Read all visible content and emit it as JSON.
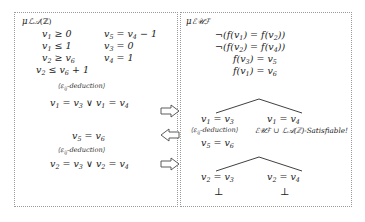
{
  "figure": {
    "left_panel": {
      "label": "μₗₐ(ℤ)",
      "label_text": "μLA(Z)",
      "constraints_col1": [
        "v₁ ≥ 0",
        "v₁ ≤ 1",
        "v₂ ≥ v₆",
        "v₂ ≤ v₆ + 1"
      ],
      "constraints_col2": [
        "v₅ = v₄ − 1",
        "v₃ = 0",
        "v₄ = 1"
      ],
      "deduction_label_1": "⟨εᵢⱼ-deduction⟩",
      "deduced_1": "v₁ = v₃ ∨ v₁ = v₄",
      "fact_1": "v₅ = v₆",
      "deduction_label_2": "⟨εᵢⱼ-deduction⟩",
      "deduced_2": "v₂ = v₃ ∨ v₂ = v₄"
    },
    "right_panel": {
      "label_text": "μEUF",
      "literals": [
        "¬(f(v₁) = f(v₂))",
        "¬(f(v₂) = f(v₄))",
        "f(v₃) = v₅",
        "f(v₁) = v₆"
      ],
      "tree1_left": "v₁ = v₃",
      "tree1_right": "v₁ = v₄",
      "tree1_deduction_label": "⟨εᵢⱼ-deduction⟩",
      "tree1_satisfiable": "ℰᵁℱ ∪ ℒᴀ(ℤ)-Satisfiable!",
      "tree1_left_child": "v₅ = v₆",
      "tree2_left": "v₂ = v₃",
      "tree2_right": "v₂ = v₄",
      "tree2_left_bottom": "⊥",
      "tree2_right_bottom": "⊥"
    },
    "arrows": [
      {
        "name": "arrow-right-top",
        "direction": "right"
      },
      {
        "name": "arrow-left-middle",
        "direction": "left"
      },
      {
        "name": "arrow-right-bottom",
        "direction": "right"
      }
    ],
    "colors": {
      "border": "#9a9a9a",
      "text": "#1a1a1a",
      "arrow_stroke": "#555555"
    }
  }
}
